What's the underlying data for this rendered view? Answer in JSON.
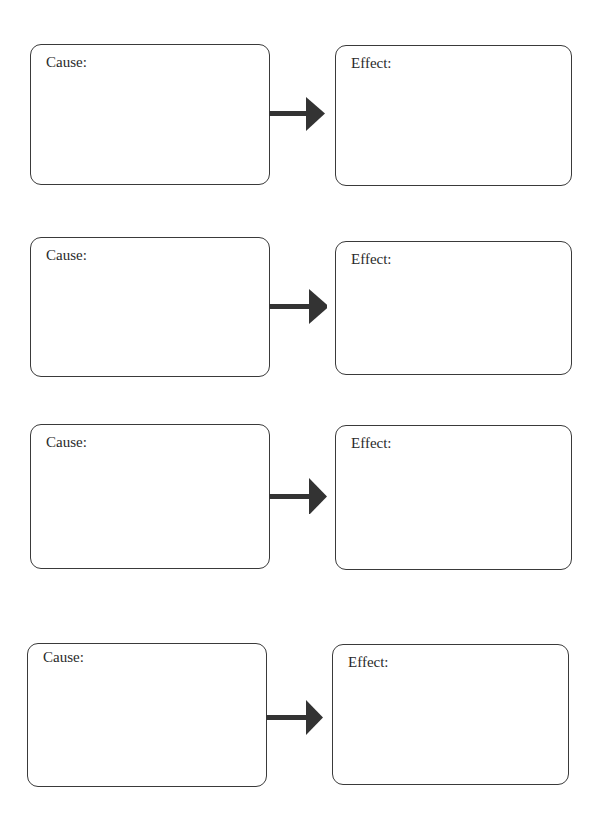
{
  "diagram": {
    "type": "cause-effect-organizer",
    "rows": [
      {
        "cause": {
          "label": "Cause:",
          "x": 30,
          "y": 44,
          "w": 240,
          "h": 141
        },
        "arrow": {
          "x": 269,
          "y": 96
        },
        "effect": {
          "label": "Effect:",
          "x": 335,
          "y": 45,
          "w": 237,
          "h": 141
        }
      },
      {
        "cause": {
          "label": "Cause:",
          "x": 30,
          "y": 237,
          "w": 240,
          "h": 140
        },
        "arrow": {
          "x": 269,
          "y": 288
        },
        "effect": {
          "label": "Effect:",
          "x": 335,
          "y": 241,
          "w": 237,
          "h": 134
        }
      },
      {
        "cause": {
          "label": "Cause:",
          "x": 30,
          "y": 424,
          "w": 240,
          "h": 145
        },
        "arrow": {
          "x": 269,
          "y": 478
        },
        "effect": {
          "label": "Effect:",
          "x": 335,
          "y": 425,
          "w": 237,
          "h": 145
        }
      },
      {
        "cause": {
          "label": "Cause:",
          "x": 27,
          "y": 643,
          "w": 240,
          "h": 144
        },
        "arrow": {
          "x": 266,
          "y": 700
        },
        "effect": {
          "label": "Effect:",
          "x": 332,
          "y": 644,
          "w": 237,
          "h": 141
        }
      }
    ],
    "colors": {
      "border": "#3a3a3a",
      "arrow": "#333333",
      "text": "#2a2a2a",
      "background": "#ffffff"
    }
  }
}
